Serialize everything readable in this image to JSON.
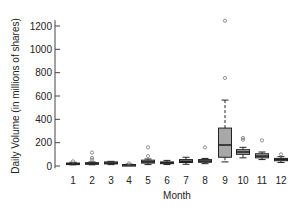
{
  "chart_data": {
    "type": "box",
    "title": "",
    "xlabel": "Month",
    "ylabel": "Daily Volume (in millions of shares)",
    "ylim": [
      0,
      1250
    ],
    "yticks": [
      0,
      200,
      400,
      600,
      800,
      1000,
      1200
    ],
    "categories": [
      "1",
      "2",
      "3",
      "4",
      "5",
      "6",
      "7",
      "8",
      "9",
      "10",
      "11",
      "12"
    ],
    "grid": false,
    "legend": null,
    "colors": {
      "box_fill": "#a8a8a8",
      "stroke": "#222222",
      "outlier": "#777777",
      "axis": "#444444"
    },
    "boxes": [
      {
        "month": "1",
        "whisker_low": 10,
        "q1": 15,
        "median": 20,
        "q3": 25,
        "whisker_high": 32,
        "outliers": [
          40
        ]
      },
      {
        "month": "2",
        "whisker_low": 10,
        "q1": 17,
        "median": 22,
        "q3": 28,
        "whisker_high": 35,
        "outliers": [
          55,
          70,
          115
        ]
      },
      {
        "month": "3",
        "whisker_low": 12,
        "q1": 18,
        "median": 25,
        "q3": 35,
        "whisker_high": 40,
        "outliers": []
      },
      {
        "month": "4",
        "whisker_low": 5,
        "q1": 8,
        "median": 10,
        "q3": 12,
        "whisker_high": 16,
        "outliers": [
          22
        ]
      },
      {
        "month": "5",
        "whisker_low": 12,
        "q1": 25,
        "median": 35,
        "q3": 50,
        "whisker_high": 60,
        "outliers": [
          85,
          160
        ]
      },
      {
        "month": "6",
        "whisker_low": 12,
        "q1": 20,
        "median": 28,
        "q3": 35,
        "whisker_high": 48,
        "outliers": []
      },
      {
        "month": "7",
        "whisker_low": 15,
        "q1": 30,
        "median": 40,
        "q3": 55,
        "whisker_high": 75,
        "outliers": []
      },
      {
        "month": "8",
        "whisker_low": 20,
        "q1": 32,
        "median": 42,
        "q3": 55,
        "whisker_high": 65,
        "outliers": [
          160
        ]
      },
      {
        "month": "9",
        "whisker_low": 35,
        "q1": 75,
        "median": 180,
        "q3": 325,
        "whisker_high": 565,
        "outliers": [
          755,
          1245
        ]
      },
      {
        "month": "10",
        "whisker_low": 70,
        "q1": 100,
        "median": 120,
        "q3": 140,
        "whisker_high": 160,
        "outliers": [
          225,
          240
        ]
      },
      {
        "month": "11",
        "whisker_low": 55,
        "q1": 70,
        "median": 85,
        "q3": 105,
        "whisker_high": 120,
        "outliers": [
          220
        ]
      },
      {
        "month": "12",
        "whisker_low": 30,
        "q1": 45,
        "median": 55,
        "q3": 65,
        "whisker_high": 80,
        "outliers": [
          100
        ]
      }
    ]
  }
}
